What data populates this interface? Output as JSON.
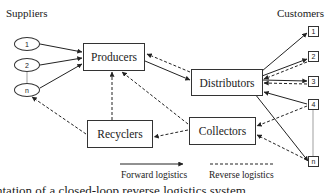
{
  "diagram": {
    "title_left": "Suppliers",
    "title_right": "Customers",
    "suppliers": [
      {
        "id": "s1",
        "label": "1"
      },
      {
        "id": "s2",
        "label": "2"
      },
      {
        "id": "sn",
        "label": "n"
      }
    ],
    "nodes": {
      "producers": "Producers",
      "distributors": "Distributors",
      "recyclers": "Recyclers",
      "collectors": "Collectors"
    },
    "customers": [
      {
        "id": "c1",
        "label": "1"
      },
      {
        "id": "c2",
        "label": "2"
      },
      {
        "id": "c3",
        "label": "3"
      },
      {
        "id": "c4",
        "label": "4"
      },
      {
        "id": "cn",
        "label": "n"
      }
    ],
    "edges": [
      {
        "from": "Supplier 1",
        "to": "Producers",
        "type": "forward"
      },
      {
        "from": "Supplier 2",
        "to": "Producers",
        "type": "forward"
      },
      {
        "from": "Supplier n",
        "to": "Producers",
        "type": "forward"
      },
      {
        "from": "Producers",
        "to": "Distributors",
        "type": "forward"
      },
      {
        "from": "Distributors",
        "to": "Producers",
        "type": "reverse"
      },
      {
        "from": "Distributors",
        "to": "Customer 1",
        "type": "forward"
      },
      {
        "from": "Distributors",
        "to": "Customer 2",
        "type": "forward"
      },
      {
        "from": "Customer 2",
        "to": "Distributors",
        "type": "reverse"
      },
      {
        "from": "Distributors",
        "to": "Customer 3",
        "type": "forward"
      },
      {
        "from": "Customer 3",
        "to": "Distributors",
        "type": "reverse"
      },
      {
        "from": "Customer 4",
        "to": "Distributors",
        "type": "forward"
      },
      {
        "from": "Distributors",
        "to": "Customer n",
        "type": "forward"
      },
      {
        "from": "Customer 4",
        "to": "Collectors",
        "type": "reverse"
      },
      {
        "from": "Customer n",
        "to": "Collectors",
        "type": "reverse"
      },
      {
        "from": "Collectors",
        "to": "Recyclers",
        "type": "reverse"
      },
      {
        "from": "Collectors",
        "to": "Producers",
        "type": "reverse"
      },
      {
        "from": "Recyclers",
        "to": "Producers",
        "type": "reverse"
      },
      {
        "from": "Recyclers",
        "to": "Supplier n",
        "type": "reverse"
      }
    ],
    "legend": {
      "forward": "Forward logistics",
      "reverse": "Reverse logistics"
    },
    "caption_partial": "ntation of a closed-loop reverse logistics system"
  }
}
